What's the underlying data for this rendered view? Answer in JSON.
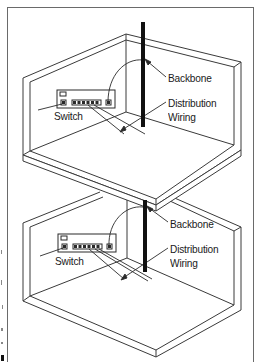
{
  "diagram": {
    "title": "",
    "floors": [
      {
        "id": "upper-floor",
        "labels": {
          "backbone": "Backbone",
          "switch": "Switch",
          "distribution_line1": "Distribution",
          "distribution_line2": "Wiring"
        }
      },
      {
        "id": "lower-floor",
        "labels": {
          "backbone": "Backbone",
          "switch": "Switch",
          "distribution_line1": "Distribution",
          "distribution_line2": "Wiring"
        }
      }
    ],
    "colors": {
      "line": "#3a3a3a",
      "backbone": "#111111",
      "frame": "#6a6a6a",
      "background": "#ffffff"
    }
  }
}
